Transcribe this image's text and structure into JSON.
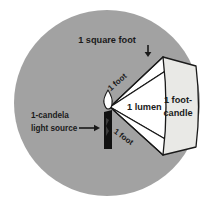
{
  "figure": {
    "colors": {
      "page_background": "#ffffff",
      "circle_fill": "#a2a2a2",
      "cone_fill": "#ffffff",
      "panel_fill": "#e9e9e6",
      "outline": "#1a1a1a",
      "candle_body": "#111111",
      "flame_fill": "#ffffff",
      "text": "#1a1a1a"
    },
    "labels": {
      "square_foot": "1 square foot",
      "light_source_line1": "1-candela",
      "light_source_line2": "light source",
      "lumen": "1 lumen",
      "footcandle_line1": "1 foot-",
      "footcandle_line2": "candle",
      "distance_top": "1 foot",
      "distance_bottom": "1 foot"
    },
    "icons": {
      "candle": "candle-icon",
      "flame": "flame-icon",
      "arrow_down": "arrow-down-icon",
      "arrow_right": "arrow-right-icon"
    }
  }
}
